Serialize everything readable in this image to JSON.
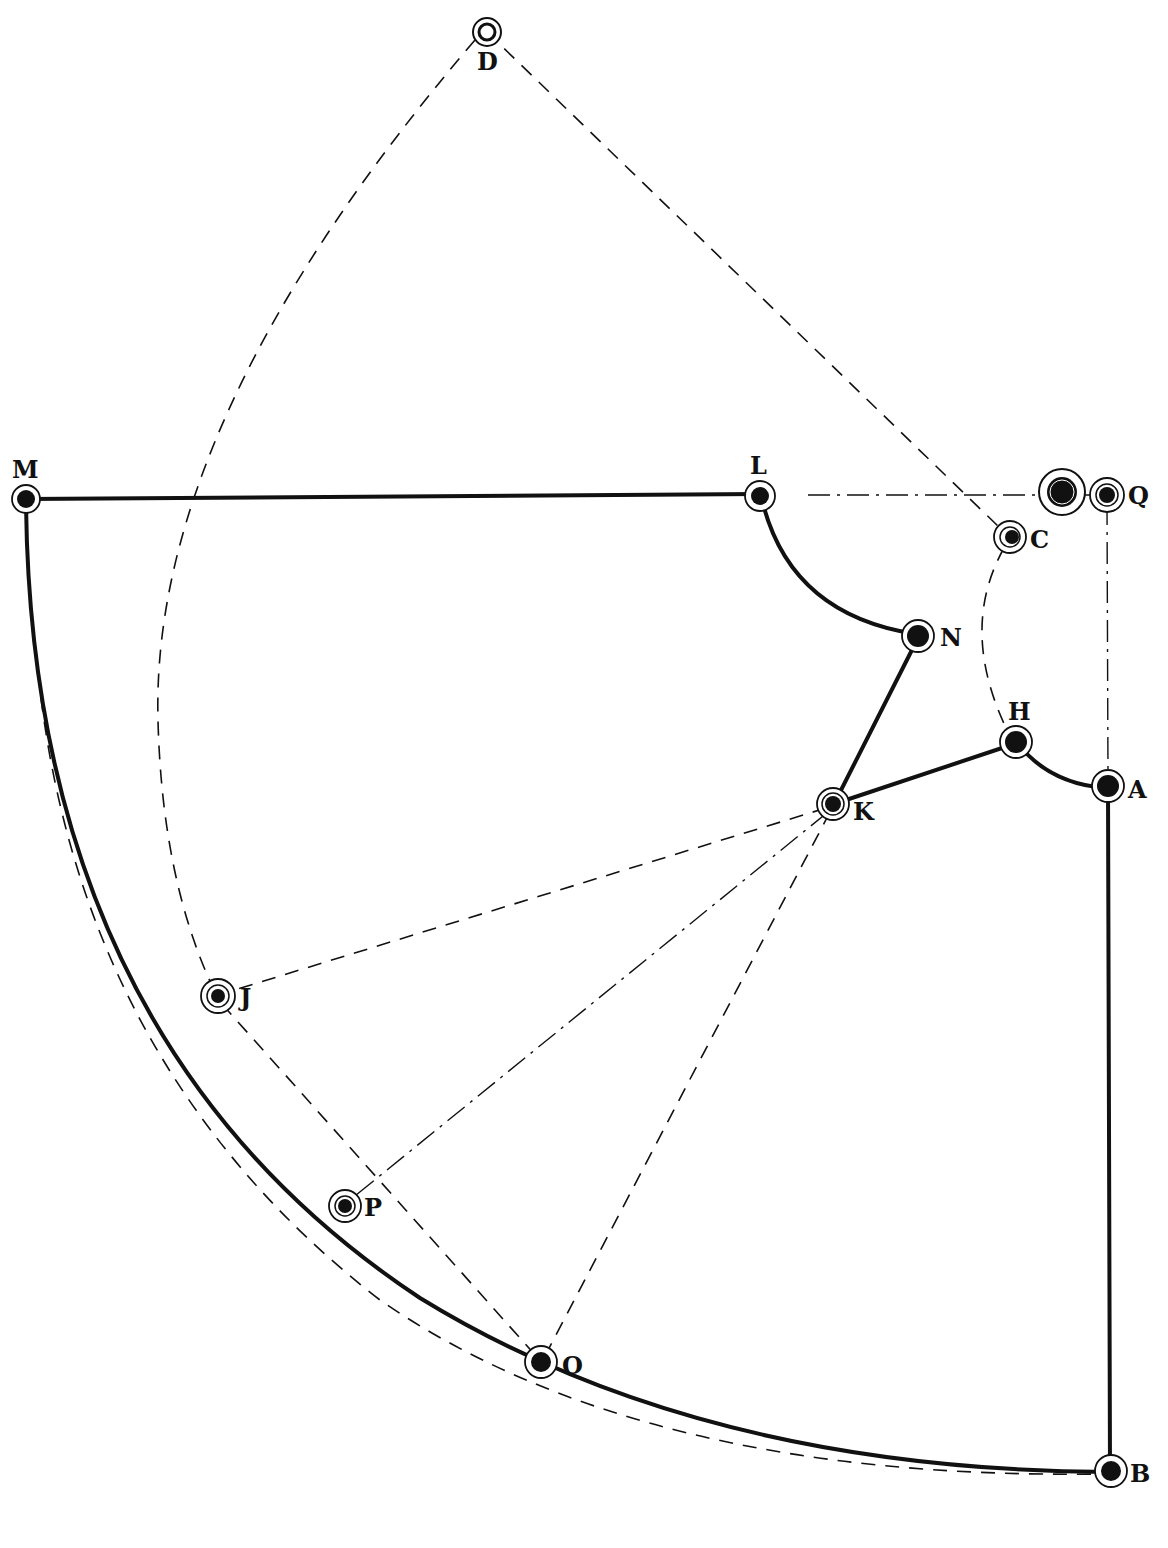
{
  "figure": {
    "type": "pattern drafting diagram",
    "caption": "",
    "colors": {
      "ink": "#111111",
      "background": "#ffffff"
    },
    "points": {
      "D": {
        "label": "D",
        "x": 487,
        "y": 32
      },
      "M": {
        "label": "M",
        "x": 26,
        "y": 499
      },
      "L": {
        "label": "L",
        "x": 760,
        "y": 496
      },
      "Q_big": {
        "label": "",
        "x": 1062,
        "y": 492
      },
      "Q": {
        "label": "Q",
        "x": 1107,
        "y": 495
      },
      "C": {
        "label": "C",
        "x": 1010,
        "y": 537
      },
      "N": {
        "label": "N",
        "x": 918,
        "y": 636
      },
      "H": {
        "label": "H",
        "x": 1016,
        "y": 742
      },
      "A": {
        "label": "A",
        "x": 1108,
        "y": 786
      },
      "K": {
        "label": "K",
        "x": 833,
        "y": 804
      },
      "J": {
        "label": "J",
        "x": 218,
        "y": 996
      },
      "P": {
        "label": "P",
        "x": 345,
        "y": 1206
      },
      "O": {
        "label": "O",
        "x": 541,
        "y": 1362
      },
      "B": {
        "label": "B",
        "x": 1111,
        "y": 1471
      }
    },
    "solid_lines": [
      "M-L",
      "L-N (curve)",
      "N-K",
      "K-H",
      "H-A (curve)",
      "A-B",
      "M-O-B (curve)"
    ],
    "dashed_lines": [
      "D-C",
      "D-J (arc)",
      "C-H (curve)",
      "K-J",
      "K-O",
      "J-O",
      "M-B outer dashed arc"
    ],
    "dash_dot_lines": [
      "L-Q",
      "Q-A",
      "K-P"
    ]
  }
}
